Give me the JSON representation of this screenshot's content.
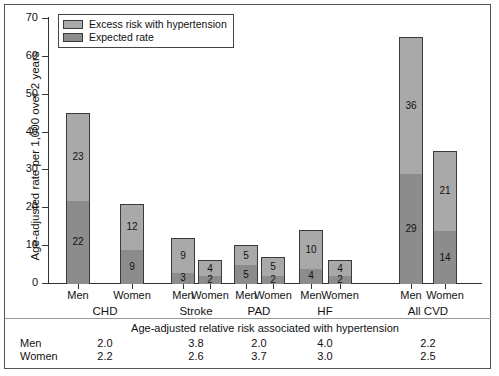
{
  "chart_data": {
    "type": "bar",
    "subtype": "stacked-bar",
    "title": "",
    "xlabel": "",
    "ylabel": "Age-adjusted rate per 1,000 over 2 years",
    "ylim": [
      0,
      70
    ],
    "yticks": [
      0,
      10,
      20,
      30,
      40,
      50,
      60,
      70
    ],
    "grid": false,
    "legend_position": "top-left",
    "legend": [
      "Excess risk with hypertension",
      "Expected rate"
    ],
    "colors": {
      "excess": "#a9a9a9",
      "expected": "#8c8c8c",
      "outline": "#3a3a3a"
    },
    "groups": [
      "CHD",
      "Stroke",
      "PAD",
      "HF",
      "All CVD"
    ],
    "categories": [
      "CHD Men",
      "CHD Women",
      "Stroke Men",
      "Stroke Women",
      "PAD Men",
      "PAD Women",
      "HF Men",
      "HF Women",
      "All CVD Men",
      "All CVD Women"
    ],
    "sex_labels": [
      "Men",
      "Women",
      "Men",
      "Women",
      "Men",
      "Women",
      "Men",
      "Women",
      "Men",
      "Women"
    ],
    "series": [
      {
        "name": "Expected rate",
        "values": [
          22,
          9,
          3,
          2,
          5,
          2,
          4,
          2,
          29,
          14
        ]
      },
      {
        "name": "Excess risk with hypertension",
        "values": [
          23,
          12,
          9,
          4,
          5,
          5,
          10,
          4,
          36,
          21
        ]
      }
    ],
    "totals": [
      45,
      21,
      12,
      6,
      10,
      7,
      14,
      6,
      65,
      35
    ],
    "relative_risk": {
      "title": "Age-adjusted relative risk associated with hypertension",
      "row_labels": [
        "Men",
        "Women"
      ],
      "men": [
        "2.0",
        "3.8",
        "2.0",
        "4.0",
        "2.2"
      ],
      "women": [
        "2.2",
        "2.6",
        "3.7",
        "3.0",
        "2.5"
      ]
    }
  },
  "axis": {
    "ytick_labels": [
      "0",
      "10",
      "20",
      "30",
      "40",
      "50",
      "60",
      "70"
    ],
    "ylabel": "Age-adjusted rate per 1,000 over 2 years"
  },
  "legend": {
    "items": [
      {
        "label": "Excess risk with hypertension",
        "swatch": "#a9a9a9"
      },
      {
        "label": "Expected rate",
        "swatch": "#8c8c8c"
      }
    ]
  },
  "bars": [
    {
      "sex": "Men",
      "group": "CHD",
      "expected": 22,
      "excess": 23,
      "expected_label": "22",
      "excess_label": "23"
    },
    {
      "sex": "Women",
      "group": "CHD",
      "expected": 9,
      "excess": 12,
      "expected_label": "9",
      "excess_label": "12"
    },
    {
      "sex": "Men",
      "group": "Stroke",
      "expected": 3,
      "excess": 9,
      "expected_label": "3",
      "excess_label": "9"
    },
    {
      "sex": "Women",
      "group": "Stroke",
      "expected": 2,
      "excess": 4,
      "expected_label": "2",
      "excess_label": "4"
    },
    {
      "sex": "Men",
      "group": "PAD",
      "expected": 5,
      "excess": 5,
      "expected_label": "5",
      "excess_label": "5"
    },
    {
      "sex": "Women",
      "group": "PAD",
      "expected": 2,
      "excess": 5,
      "expected_label": "2",
      "excess_label": "5"
    },
    {
      "sex": "Men",
      "group": "HF",
      "expected": 4,
      "excess": 10,
      "expected_label": "4",
      "excess_label": "10"
    },
    {
      "sex": "Women",
      "group": "HF",
      "expected": 2,
      "excess": 4,
      "expected_label": "2",
      "excess_label": "4"
    },
    {
      "sex": "Men",
      "group": "All CVD",
      "expected": 29,
      "excess": 36,
      "expected_label": "29",
      "excess_label": "36"
    },
    {
      "sex": "Women",
      "group": "All CVD",
      "expected": 14,
      "excess": 21,
      "expected_label": "14",
      "excess_label": "21"
    }
  ],
  "groups": [
    "CHD",
    "Stroke",
    "PAD",
    "HF",
    "All CVD"
  ],
  "risk_table": {
    "title": "Age-adjusted relative risk associated with hypertension",
    "rows": [
      {
        "label": "Men",
        "values": [
          "2.0",
          "3.8",
          "2.0",
          "4.0",
          "2.2"
        ]
      },
      {
        "label": "Women",
        "values": [
          "2.2",
          "2.6",
          "3.7",
          "3.0",
          "2.5"
        ]
      }
    ]
  }
}
